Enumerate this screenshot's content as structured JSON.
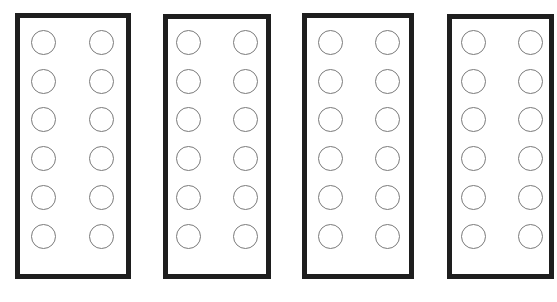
{
  "diagram": {
    "border_color": "#1e1e1e",
    "circle_stroke_color": "#7a7a7a",
    "panels": [
      {
        "id": 1,
        "left": 15,
        "top": 13,
        "width": 116,
        "height": 266,
        "col_x": [
          43,
          101
        ],
        "rows": 6
      },
      {
        "id": 2,
        "left": 163,
        "top": 14,
        "width": 108,
        "height": 265,
        "col_x": [
          188,
          245
        ],
        "rows": 6
      },
      {
        "id": 3,
        "left": 302,
        "top": 13,
        "width": 112,
        "height": 266,
        "col_x": [
          330,
          387
        ],
        "rows": 6
      },
      {
        "id": 4,
        "left": 447,
        "top": 14,
        "width": 107,
        "height": 265,
        "col_x": [
          473,
          530
        ],
        "rows": 6
      }
    ],
    "row_y": [
      42,
      81,
      119,
      158,
      197,
      236
    ],
    "circle_diameter": 25
  }
}
